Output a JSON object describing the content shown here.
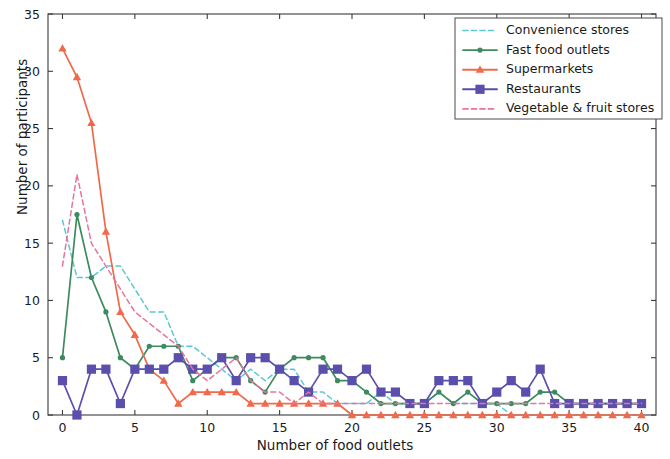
{
  "chart_data": {
    "type": "line",
    "title": "",
    "xlabel": "Number of food outlets",
    "ylabel": "Number of participants",
    "xlim": [
      -1,
      41
    ],
    "ylim": [
      0,
      35
    ],
    "xticks": [
      0,
      5,
      10,
      15,
      20,
      25,
      30,
      35,
      40
    ],
    "yticks": [
      0,
      5,
      10,
      15,
      20,
      25,
      30,
      35
    ],
    "grid": false,
    "legend_position": "upper right",
    "x": [
      0,
      1,
      2,
      3,
      4,
      5,
      6,
      7,
      8,
      9,
      10,
      11,
      12,
      13,
      14,
      15,
      16,
      17,
      18,
      19,
      20,
      21,
      22,
      23,
      24,
      25,
      26,
      27,
      28,
      29,
      30,
      31,
      32,
      33,
      34,
      35,
      36,
      37,
      38,
      39,
      40
    ],
    "series": [
      {
        "name": "Convenience stores",
        "color": "#5bc8d4",
        "linestyle": "dashed",
        "marker": "none",
        "values": [
          17,
          12,
          12,
          13,
          13,
          11,
          9,
          9,
          6,
          6,
          5,
          4,
          3,
          4,
          3,
          4,
          4,
          2,
          2,
          1,
          1,
          1,
          2,
          1,
          1,
          1,
          2,
          1,
          1,
          1,
          1,
          0,
          0,
          0,
          0,
          0,
          0,
          0,
          0,
          0,
          0
        ]
      },
      {
        "name": "Fast food outlets",
        "color": "#3d8a5f",
        "linestyle": "solid",
        "marker": "circle",
        "values": [
          5,
          17.5,
          12,
          9,
          5,
          4,
          6,
          6,
          6,
          3,
          4,
          5,
          5,
          3,
          2,
          4,
          5,
          5,
          5,
          3,
          3,
          2,
          1,
          1,
          1,
          1,
          2,
          1,
          2,
          1,
          1,
          1,
          1,
          2,
          2,
          1,
          1,
          1,
          1,
          1,
          1
        ]
      },
      {
        "name": "Supermarkets",
        "color": "#ef6a4c",
        "linestyle": "solid",
        "marker": "triangle",
        "values": [
          32,
          29.5,
          25.5,
          16,
          9,
          7,
          4,
          3,
          1,
          2,
          2,
          2,
          2,
          1,
          1,
          1,
          1,
          1,
          1,
          1,
          0,
          0,
          0,
          0,
          0,
          0,
          0,
          0,
          0,
          0,
          0,
          0,
          0,
          0,
          0,
          0,
          0,
          0,
          0,
          0,
          0
        ]
      },
      {
        "name": "Restaurants",
        "color": "#5a4fad",
        "linestyle": "solid",
        "marker": "square",
        "values": [
          3,
          0,
          4,
          4,
          1,
          4,
          4,
          4,
          5,
          4,
          4,
          5,
          3,
          5,
          5,
          4,
          3,
          2,
          4,
          4,
          3,
          4,
          2,
          2,
          1,
          1,
          3,
          3,
          3,
          1,
          2,
          3,
          2,
          4,
          1,
          1,
          1,
          1,
          1,
          1,
          1
        ]
      },
      {
        "name": "Vegetable & fruit stores",
        "color": "#e8739e",
        "linestyle": "dashed",
        "marker": "none",
        "values": [
          13,
          21,
          15,
          13,
          11,
          9,
          8,
          7,
          6,
          4,
          3,
          4,
          5,
          3,
          2,
          2,
          1,
          2,
          1,
          1,
          1,
          1,
          1,
          1,
          1,
          1,
          1,
          1,
          1,
          1,
          1,
          1,
          1,
          1,
          1,
          1,
          1,
          1,
          1,
          1,
          1
        ]
      }
    ]
  },
  "axes": {
    "xlabel": "Number of food outlets",
    "ylabel": "Number of participants"
  },
  "legend": {
    "items": [
      {
        "label": "Convenience stores"
      },
      {
        "label": "Fast food outlets"
      },
      {
        "label": "Supermarkets"
      },
      {
        "label": "Restaurants"
      },
      {
        "label": "Vegetable & fruit stores"
      }
    ]
  }
}
